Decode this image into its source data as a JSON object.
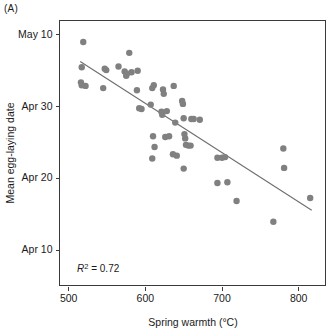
{
  "figure": {
    "panel_label": "(A)",
    "annotation": {
      "symbol": "R",
      "superscript": "2",
      "equals_value": "= 0.72",
      "full": "R2 = 0.72"
    }
  },
  "colors": {
    "point": "#808080",
    "fit_line": "#6e6e6e",
    "axis": "#3a3a3a",
    "text": "#1a1a1a",
    "background": "#ffffff"
  },
  "chart_data": {
    "type": "scatter",
    "title": "",
    "xlabel": "Spring warmth (°C)",
    "ylabel": "Mean egg-laying date",
    "xlim": [
      488,
      835
    ],
    "ylim": [
      5.0,
      42.0
    ],
    "grid": false,
    "legend": null,
    "xticks": [
      500,
      600,
      700,
      800
    ],
    "xtick_labels": [
      "500",
      "600",
      "700",
      "800"
    ],
    "yticks": [
      40,
      30,
      20,
      10
    ],
    "ytick_labels": [
      "May 10",
      "Apr 30",
      "Apr 20",
      "Apr 10"
    ],
    "y_axis_note": "y values are day-of-April index; 31 = May 1, 40 = May 10",
    "annotations": [
      {
        "text": "R2 = 0.72",
        "x": 530,
        "y": 8.5,
        "r_squared": 0.72
      }
    ],
    "points": [
      {
        "x": 519,
        "y": 39.0
      },
      {
        "x": 517,
        "y": 35.5
      },
      {
        "x": 516,
        "y": 33.4
      },
      {
        "x": 517,
        "y": 33.0
      },
      {
        "x": 522,
        "y": 32.9
      },
      {
        "x": 547,
        "y": 35.3
      },
      {
        "x": 549,
        "y": 35.1
      },
      {
        "x": 545,
        "y": 32.6
      },
      {
        "x": 565,
        "y": 35.6
      },
      {
        "x": 573,
        "y": 34.9
      },
      {
        "x": 575,
        "y": 34.3
      },
      {
        "x": 576,
        "y": 34.6
      },
      {
        "x": 579,
        "y": 37.5
      },
      {
        "x": 582,
        "y": 34.8
      },
      {
        "x": 590,
        "y": 35.0
      },
      {
        "x": 589,
        "y": 32.3
      },
      {
        "x": 592,
        "y": 29.8
      },
      {
        "x": 595,
        "y": 29.7
      },
      {
        "x": 607,
        "y": 30.3
      },
      {
        "x": 609,
        "y": 32.6
      },
      {
        "x": 611,
        "y": 33.0
      },
      {
        "x": 610,
        "y": 25.9
      },
      {
        "x": 612,
        "y": 24.4
      },
      {
        "x": 609,
        "y": 22.8
      },
      {
        "x": 621,
        "y": 29.3
      },
      {
        "x": 622,
        "y": 28.9
      },
      {
        "x": 624,
        "y": 31.8
      },
      {
        "x": 623,
        "y": 32.4
      },
      {
        "x": 628,
        "y": 29.4
      },
      {
        "x": 631,
        "y": 25.9
      },
      {
        "x": 626,
        "y": 25.8
      },
      {
        "x": 637,
        "y": 32.9
      },
      {
        "x": 639,
        "y": 27.8
      },
      {
        "x": 641,
        "y": 23.2
      },
      {
        "x": 636,
        "y": 23.4
      },
      {
        "x": 648,
        "y": 30.8
      },
      {
        "x": 649,
        "y": 30.4
      },
      {
        "x": 650,
        "y": 28.4
      },
      {
        "x": 651,
        "y": 26.2
      },
      {
        "x": 652,
        "y": 25.6
      },
      {
        "x": 653,
        "y": 24.7
      },
      {
        "x": 650,
        "y": 21.4
      },
      {
        "x": 656,
        "y": 24.6
      },
      {
        "x": 660,
        "y": 28.3
      },
      {
        "x": 663,
        "y": 28.3
      },
      {
        "x": 659,
        "y": 24.6
      },
      {
        "x": 671,
        "y": 28.2
      },
      {
        "x": 694,
        "y": 22.9
      },
      {
        "x": 700,
        "y": 22.9
      },
      {
        "x": 704,
        "y": 23.0
      },
      {
        "x": 694,
        "y": 19.4
      },
      {
        "x": 707,
        "y": 19.5
      },
      {
        "x": 719,
        "y": 16.9
      },
      {
        "x": 767,
        "y": 14.0
      },
      {
        "x": 780,
        "y": 24.2
      },
      {
        "x": 781,
        "y": 21.5
      },
      {
        "x": 815,
        "y": 17.3
      }
    ],
    "fit_line": {
      "type": "linear_regression",
      "x_start": 515,
      "y_start": 36.3,
      "x_end": 817,
      "y_end": 15.6,
      "r_squared": 0.72
    }
  }
}
